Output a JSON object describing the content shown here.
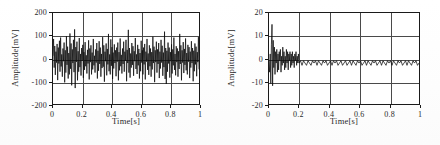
{
  "figure": {
    "panel_count": 2
  },
  "chart_data": [
    {
      "id": "left-panel",
      "type": "line",
      "title": "",
      "xlabel": "Time[s]",
      "ylabel": "Amplitude[mV]",
      "xlim": [
        0,
        1
      ],
      "ylim": [
        -200,
        200
      ],
      "xticks": [
        0,
        0.2,
        0.4,
        0.6,
        0.8,
        1
      ],
      "xticklabels": [
        "0",
        "0.2",
        "0.4",
        "0.6",
        "0.8",
        "1"
      ],
      "yticks": [
        -200,
        -100,
        0,
        100,
        200
      ],
      "yticklabels": [
        "-200",
        "-100",
        "0",
        "100",
        "200"
      ],
      "grid": true,
      "legend": null,
      "series": [
        {
          "name": "raw signal",
          "color": "#0d0d0d",
          "description": "broadband noise, peak-to-peak about 260 mV, mean near 0 mV",
          "x": [
            0.0,
            0.004,
            0.008,
            0.012,
            0.016,
            0.02,
            0.024,
            0.028,
            0.032,
            0.036,
            0.04,
            0.044,
            0.048,
            0.052,
            0.056,
            0.06,
            0.064,
            0.068,
            0.072,
            0.076,
            0.08,
            0.084,
            0.088,
            0.092,
            0.096,
            0.1,
            0.104,
            0.108,
            0.112,
            0.116,
            0.12,
            0.124,
            0.128,
            0.132,
            0.136,
            0.14,
            0.144,
            0.148,
            0.152,
            0.156,
            0.16,
            0.164,
            0.168,
            0.172,
            0.176,
            0.18,
            0.184,
            0.188,
            0.192,
            0.196,
            0.2,
            0.204,
            0.208,
            0.212,
            0.216,
            0.22,
            0.224,
            0.228,
            0.232,
            0.236,
            0.24,
            0.244,
            0.248,
            0.252,
            0.256,
            0.26,
            0.264,
            0.268,
            0.272,
            0.276,
            0.28,
            0.284,
            0.288,
            0.292,
            0.296,
            0.3,
            0.304,
            0.308,
            0.312,
            0.316,
            0.32,
            0.324,
            0.328,
            0.332,
            0.336,
            0.34,
            0.344,
            0.348,
            0.352,
            0.356,
            0.36,
            0.364,
            0.368,
            0.372,
            0.376,
            0.38,
            0.384,
            0.388,
            0.392,
            0.396,
            0.4,
            0.404,
            0.408,
            0.412,
            0.416,
            0.42,
            0.424,
            0.428,
            0.432,
            0.436,
            0.44,
            0.444,
            0.448,
            0.452,
            0.456,
            0.46,
            0.464,
            0.468,
            0.472,
            0.476,
            0.48,
            0.484,
            0.488,
            0.492,
            0.496,
            0.5,
            0.504,
            0.508,
            0.512,
            0.516,
            0.52,
            0.524,
            0.528,
            0.532,
            0.536,
            0.54,
            0.544,
            0.548,
            0.552,
            0.556,
            0.56,
            0.564,
            0.568,
            0.572,
            0.576,
            0.58,
            0.584,
            0.588,
            0.592,
            0.596,
            0.6,
            0.604,
            0.608,
            0.612,
            0.616,
            0.62,
            0.624,
            0.628,
            0.632,
            0.636,
            0.64,
            0.644,
            0.648,
            0.652,
            0.656,
            0.66,
            0.664,
            0.668,
            0.672,
            0.676,
            0.68,
            0.684,
            0.688,
            0.692,
            0.696,
            0.7,
            0.704,
            0.708,
            0.712,
            0.716,
            0.72,
            0.724,
            0.728,
            0.732,
            0.736,
            0.74,
            0.744,
            0.748,
            0.752,
            0.756,
            0.76,
            0.764,
            0.768,
            0.772,
            0.776,
            0.78,
            0.784,
            0.788,
            0.792,
            0.796,
            0.8,
            0.804,
            0.808,
            0.812,
            0.816,
            0.82,
            0.824,
            0.828,
            0.832,
            0.836,
            0.84,
            0.844,
            0.848,
            0.852,
            0.856,
            0.86,
            0.864,
            0.868,
            0.872,
            0.876,
            0.88,
            0.884,
            0.888,
            0.892,
            0.896,
            0.9,
            0.904,
            0.908,
            0.912,
            0.916,
            0.92,
            0.924,
            0.928,
            0.932,
            0.936,
            0.94,
            0.944,
            0.948,
            0.952,
            0.956,
            0.96,
            0.964,
            0.968,
            0.972,
            0.976,
            0.98,
            0.984,
            0.988,
            0.992,
            0.996,
            1.0
          ],
          "y": [
            12,
            86,
            -40,
            55,
            -72,
            30,
            -18,
            64,
            -95,
            48,
            -22,
            78,
            -58,
            92,
            -35,
            18,
            -80,
            44,
            -12,
            70,
            -105,
            36,
            -62,
            98,
            -28,
            52,
            -88,
            24,
            -70,
            110,
            -45,
            66,
            -118,
            40,
            -20,
            82,
            -60,
            128,
            -130,
            50,
            -15,
            74,
            -96,
            32,
            -58,
            90,
            -38,
            20,
            -75,
            46,
            -10,
            60,
            -85,
            28,
            -50,
            72,
            -34,
            14,
            -66,
            38,
            -22,
            80,
            -92,
            44,
            -16,
            58,
            -70,
            26,
            -48,
            86,
            -30,
            12,
            -62,
            40,
            -18,
            68,
            -88,
            34,
            -54,
            76,
            -24,
            48,
            -80,
            20,
            -42,
            94,
            -36,
            58,
            -102,
            30,
            -12,
            66,
            -74,
            42,
            -26,
            108,
            -56,
            18,
            -70,
            84,
            -32,
            50,
            -90,
            26,
            -44,
            62,
            -20,
            36,
            -78,
            48,
            -14,
            70,
            -96,
            28,
            -52,
            88,
            -34,
            16,
            -66,
            44,
            -24,
            74,
            -58,
            30,
            -10,
            82,
            -100,
            38,
            -20,
            126,
            -62,
            46,
            -84,
            22,
            -40,
            68,
            -28,
            54,
            -76,
            32,
            -12,
            90,
            -46,
            18,
            -68,
            60,
            -30,
            42,
            -88,
            24,
            -56,
            78,
            -18,
            36,
            -70,
            48,
            -26,
            64,
            -92,
            30,
            -14,
            86,
            -50,
            22,
            -72,
            58,
            -34,
            44,
            -80,
            28,
            -48,
            96,
            -20,
            52,
            -104,
            36,
            -16,
            74,
            -62,
            40,
            -24,
            68,
            -86,
            30,
            -44,
            82,
            -18,
            56,
            -76,
            26,
            -38,
            118,
            -90,
            46,
            -112,
            34,
            -58,
            70,
            -22,
            48,
            -84,
            28,
            -12,
            62,
            -66,
            40,
            -30,
            92,
            -50,
            20,
            -74,
            54,
            -16,
            44,
            -80,
            32,
            -46,
            108,
            -24,
            58,
            -96,
            36,
            -18,
            72,
            -64,
            42,
            -28,
            88,
            -52,
            24,
            -70,
            60,
            -14,
            50,
            -86,
            30,
            -40,
            76,
            -20,
            46,
            -100,
            34,
            -56,
            66,
            -26,
            52,
            -78,
            28,
            -16,
            94,
            -48,
            22,
            -68,
            58,
            -32,
            44,
            -84,
            26,
            -52,
            70,
            -18,
            40,
            -90,
            30,
            -22,
            62,
            -120,
            36,
            -10
          ]
        }
      ]
    },
    {
      "id": "right-panel",
      "type": "line",
      "title": "",
      "xlabel": "Time[s]",
      "ylabel": "Amplitude[mV]",
      "xlim": [
        0,
        1
      ],
      "ylim": [
        -20,
        20
      ],
      "xticks": [
        0,
        0.2,
        0.4,
        0.6,
        0.8,
        1
      ],
      "xticklabels": [
        "0",
        "0.2",
        "0.4",
        "0.6",
        "0.8",
        "1"
      ],
      "yticks": [
        -20,
        -10,
        0,
        10,
        20
      ],
      "yticklabels": [
        "-20",
        "-10",
        "0",
        "10",
        "20"
      ],
      "grid": true,
      "legend": null,
      "series": [
        {
          "name": "filtered signal",
          "color": "#0d0d0d",
          "description": "low-amplitude residual noise about -2 mV mean, peak-to-peak under 6 mV, with a large transient spike near t = 0.02 s reaching about +15 mV and -12 mV",
          "x": [
            0.0,
            0.004,
            0.008,
            0.012,
            0.016,
            0.02,
            0.024,
            0.028,
            0.032,
            0.036,
            0.04,
            0.044,
            0.048,
            0.052,
            0.056,
            0.06,
            0.064,
            0.068,
            0.072,
            0.076,
            0.08,
            0.084,
            0.088,
            0.092,
            0.096,
            0.1,
            0.104,
            0.108,
            0.112,
            0.116,
            0.12,
            0.124,
            0.128,
            0.132,
            0.136,
            0.14,
            0.144,
            0.148,
            0.152,
            0.156,
            0.16,
            0.164,
            0.168,
            0.172,
            0.176,
            0.18,
            0.184,
            0.188,
            0.192,
            0.196,
            0.2,
            0.21,
            0.22,
            0.23,
            0.24,
            0.25,
            0.26,
            0.27,
            0.28,
            0.29,
            0.3,
            0.31,
            0.32,
            0.33,
            0.34,
            0.35,
            0.36,
            0.37,
            0.38,
            0.39,
            0.4,
            0.41,
            0.42,
            0.43,
            0.44,
            0.45,
            0.46,
            0.47,
            0.48,
            0.49,
            0.5,
            0.51,
            0.52,
            0.53,
            0.54,
            0.55,
            0.56,
            0.57,
            0.58,
            0.59,
            0.6,
            0.61,
            0.62,
            0.63,
            0.64,
            0.65,
            0.66,
            0.67,
            0.68,
            0.69,
            0.7,
            0.71,
            0.72,
            0.73,
            0.74,
            0.75,
            0.76,
            0.77,
            0.78,
            0.79,
            0.8,
            0.81,
            0.82,
            0.83,
            0.84,
            0.85,
            0.86,
            0.87,
            0.88,
            0.89,
            0.9,
            0.91,
            0.92,
            0.93,
            0.94,
            0.95,
            0.96,
            0.97,
            0.98,
            0.99,
            1.0
          ],
          "y": [
            -1,
            -6,
            2,
            -11,
            6,
            15,
            -12,
            8,
            -4,
            5,
            -7,
            3,
            -2,
            4,
            -6,
            2,
            -5,
            3,
            -1,
            4,
            -6,
            1,
            -3,
            5,
            -2,
            3,
            -5,
            1,
            -4,
            4,
            -2,
            3,
            -5,
            2,
            -1,
            3,
            -4,
            2,
            -3,
            3,
            -2,
            1,
            -4,
            2,
            -1,
            3,
            -3,
            1,
            -2,
            2,
            -2,
            -1,
            -3,
            -1,
            -2,
            -3,
            -1,
            -2,
            -3,
            -1,
            -2,
            -1,
            -3,
            -1,
            -2,
            -3,
            -1,
            -2,
            -1,
            -3,
            -2,
            -1,
            -3,
            -1,
            -2,
            -1,
            -3,
            -2,
            -1,
            -3,
            -2,
            -1,
            -3,
            -2,
            -1,
            -3,
            -1,
            -2,
            -3,
            -1,
            -2,
            -1,
            -3,
            -2,
            -1,
            -3,
            -1,
            -2,
            -3,
            -1,
            -2,
            -1,
            -3,
            -2,
            -1,
            -3,
            -1,
            -2,
            -3,
            -1,
            -2,
            -1,
            -3,
            -1,
            -2,
            -3,
            -1,
            -2,
            -1,
            -3,
            -2,
            -1,
            -3,
            -1,
            -2,
            -3,
            -1,
            -2,
            -1,
            -3,
            -2,
            -2
          ]
        }
      ]
    }
  ]
}
